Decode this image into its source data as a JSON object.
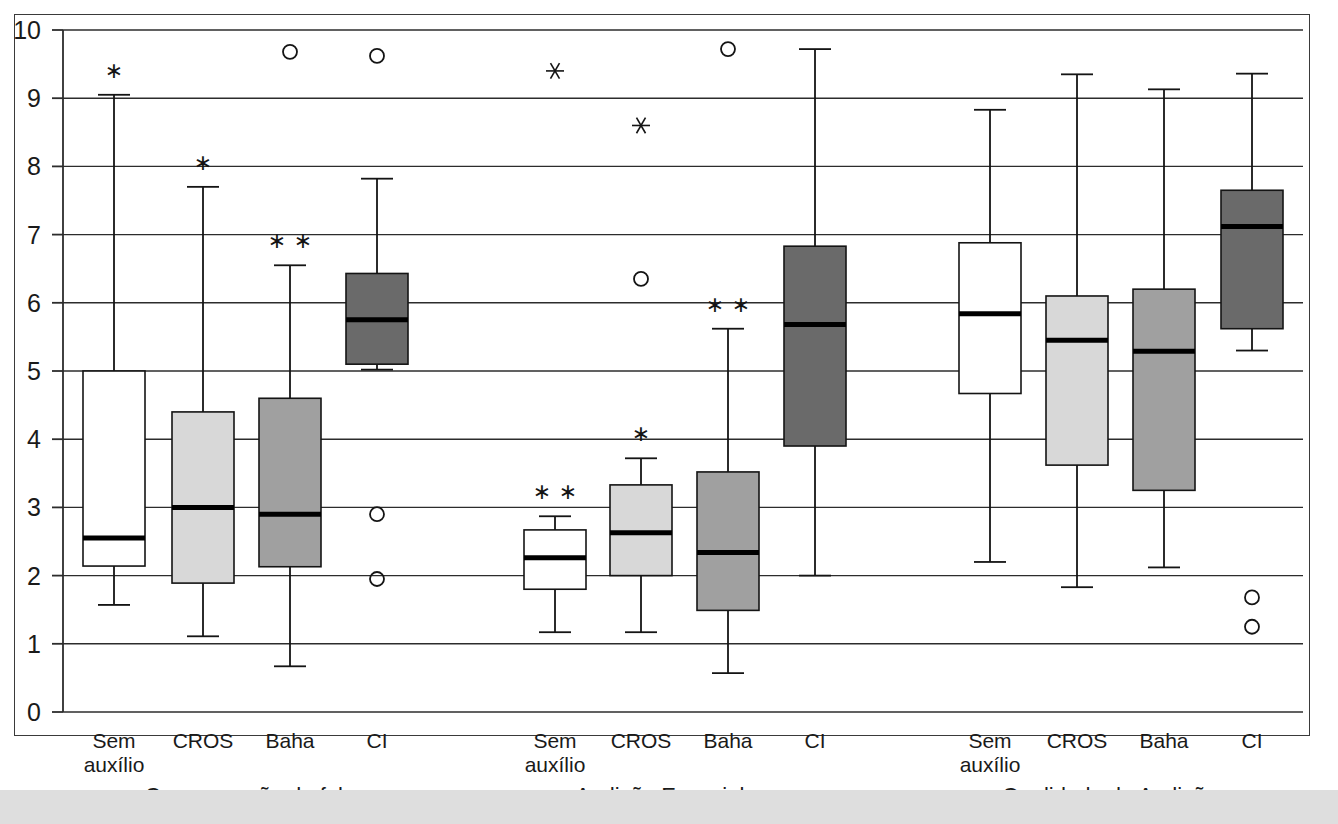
{
  "chart_data": {
    "type": "box",
    "title": "",
    "xlabel": "",
    "ylabel": "",
    "ylim": [
      0,
      10
    ],
    "yticks": [
      0,
      1,
      2,
      3,
      4,
      5,
      6,
      7,
      8,
      9,
      10
    ],
    "ytick_labels": [
      "0",
      "1",
      "2",
      "3",
      "4",
      "5",
      "6",
      "7",
      "8",
      "9",
      "10"
    ],
    "grid": "horizontal",
    "legend": "none",
    "group_labels": [
      "Compreensão da fala",
      "Audição Espacial",
      "Qualidade de Audição"
    ],
    "categories": [
      "Sem auxílio",
      "CROS",
      "Baha",
      "CI"
    ],
    "category_colors": {
      "Sem auxílio": "#ffffff",
      "CROS": "#d8d8d8",
      "Baha": "#a0a0a0",
      "CI": "#6a6a6a"
    },
    "marker_legend": {
      "circle": "outlier",
      "star": "extreme outlier"
    },
    "groups": [
      {
        "name": "Compreensão da fala",
        "boxes": [
          {
            "label": "Sem auxílio",
            "color": "#ffffff",
            "whisker_low": 1.57,
            "q1": 2.14,
            "median": 2.55,
            "q3": 5.0,
            "whisker_high": 9.05,
            "outliers": [],
            "extremes": [],
            "star_marks": 1
          },
          {
            "label": "CROS",
            "color": "#d8d8d8",
            "whisker_low": 1.11,
            "q1": 1.89,
            "median": 3.0,
            "q3": 4.4,
            "whisker_high": 7.7,
            "outliers": [],
            "extremes": [],
            "star_marks": 1
          },
          {
            "label": "Baha",
            "color": "#a0a0a0",
            "whisker_low": 0.67,
            "q1": 2.13,
            "median": 2.9,
            "q3": 4.6,
            "whisker_high": 6.55,
            "outliers": [
              9.68
            ],
            "extremes": [],
            "star_marks": 2
          },
          {
            "label": "CI",
            "color": "#6a6a6a",
            "whisker_low": 5.02,
            "q1": 5.1,
            "median": 5.75,
            "q3": 6.43,
            "whisker_high": 7.82,
            "outliers": [
              9.62,
              2.9,
              1.95
            ],
            "extremes": [],
            "star_marks": 0
          }
        ]
      },
      {
        "name": "Audição Espacial",
        "boxes": [
          {
            "label": "Sem auxílio",
            "color": "#ffffff",
            "whisker_low": 1.17,
            "q1": 1.8,
            "median": 2.26,
            "q3": 2.67,
            "whisker_high": 2.87,
            "outliers": [],
            "extremes": [
              9.4
            ],
            "star_marks": 2
          },
          {
            "label": "CROS",
            "color": "#d8d8d8",
            "whisker_low": 1.17,
            "q1": 2.0,
            "median": 2.63,
            "q3": 3.33,
            "whisker_high": 3.72,
            "outliers": [
              6.35
            ],
            "extremes": [
              8.6
            ],
            "star_marks": 1
          },
          {
            "label": "Baha",
            "color": "#a0a0a0",
            "whisker_low": 0.57,
            "q1": 1.49,
            "median": 2.34,
            "q3": 3.52,
            "whisker_high": 5.62,
            "outliers": [
              9.72
            ],
            "extremes": [],
            "star_marks": 2
          },
          {
            "label": "CI",
            "color": "#6a6a6a",
            "whisker_low": 2.0,
            "q1": 3.9,
            "median": 5.68,
            "q3": 6.83,
            "whisker_high": 9.72,
            "outliers": [],
            "extremes": [],
            "star_marks": 0
          }
        ]
      },
      {
        "name": "Qualidade de Audição",
        "boxes": [
          {
            "label": "Sem auxílio",
            "color": "#ffffff",
            "whisker_low": 2.2,
            "q1": 4.67,
            "median": 5.84,
            "q3": 6.88,
            "whisker_high": 8.83,
            "outliers": [],
            "extremes": [],
            "star_marks": 0
          },
          {
            "label": "CROS",
            "color": "#d8d8d8",
            "whisker_low": 1.83,
            "q1": 3.62,
            "median": 5.45,
            "q3": 6.1,
            "whisker_high": 9.35,
            "outliers": [],
            "extremes": [],
            "star_marks": 0
          },
          {
            "label": "Baha",
            "color": "#a0a0a0",
            "whisker_low": 2.12,
            "q1": 3.25,
            "median": 5.29,
            "q3": 6.2,
            "whisker_high": 9.13,
            "outliers": [],
            "extremes": [],
            "star_marks": 0
          },
          {
            "label": "CI",
            "color": "#6a6a6a",
            "whisker_low": 5.3,
            "q1": 5.62,
            "median": 7.12,
            "q3": 7.65,
            "whisker_high": 9.36,
            "outliers": [
              1.68,
              1.25
            ],
            "extremes": [],
            "star_marks": 0
          }
        ]
      }
    ]
  },
  "axis": {
    "y_labels": [
      "10",
      "9",
      "8",
      "7",
      "6",
      "5",
      "4",
      "3",
      "2",
      "1",
      "0"
    ]
  },
  "x_axis": {
    "tick_labels": [
      {
        "line1": "Sem",
        "line2": "auxílio"
      },
      {
        "line1": "CROS",
        "line2": ""
      },
      {
        "line1": "Baha",
        "line2": ""
      },
      {
        "line1": "CI",
        "line2": ""
      },
      {
        "line1": "Sem",
        "line2": "auxílio"
      },
      {
        "line1": "CROS",
        "line2": ""
      },
      {
        "line1": "Baha",
        "line2": ""
      },
      {
        "line1": "CI",
        "line2": ""
      },
      {
        "line1": "Sem",
        "line2": "auxílio"
      },
      {
        "line1": "CROS",
        "line2": ""
      },
      {
        "line1": "Baha",
        "line2": ""
      },
      {
        "line1": "CI",
        "line2": ""
      }
    ],
    "group_titles": [
      "Compreensão da fala",
      "Audição Espacial",
      "Qualidade de Audição"
    ]
  }
}
